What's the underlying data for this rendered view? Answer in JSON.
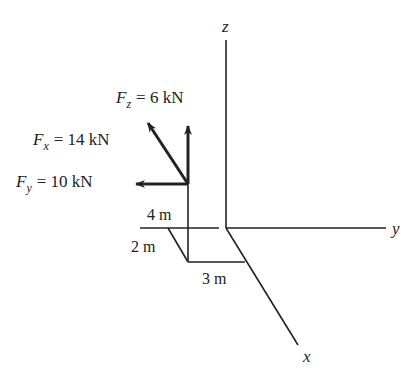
{
  "diagram": {
    "type": "3d-force-diagram",
    "axes": {
      "z_label": "z",
      "y_label": "y",
      "x_label": "x"
    },
    "forces": [
      {
        "symbol": "F",
        "subscript": "z",
        "value_text": "= 6 kN",
        "direction": "+z"
      },
      {
        "symbol": "F",
        "subscript": "x",
        "value_text": "= 14 kN",
        "direction": "-x"
      },
      {
        "symbol": "F",
        "subscript": "y",
        "value_text": "= 10 kN",
        "direction": "-y"
      }
    ],
    "dimensions": [
      {
        "label": "4 m"
      },
      {
        "label": "2 m"
      },
      {
        "label": "3 m"
      }
    ],
    "colors": {
      "line": "#222222",
      "background": "#ffffff"
    }
  }
}
